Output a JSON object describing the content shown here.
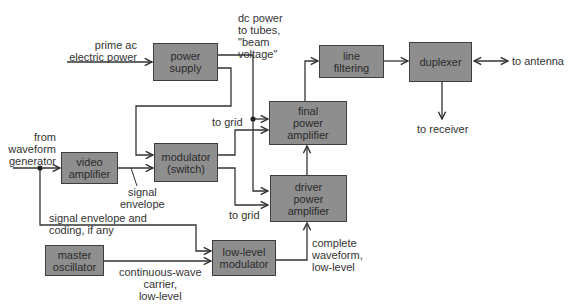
{
  "diagram": {
    "colors": {
      "block_fill": "#8e8e8e",
      "block_border": "#3d3d3d",
      "line": "#333333",
      "text": "#2a2a2a",
      "background": "#ffffff"
    },
    "blocks": {
      "power_supply": "power\nsupply",
      "video_amplifier": "video\namplifier",
      "modulator": "modulator\n(switch)",
      "final_power_amplifier": "final\npower\namplifier",
      "driver_power_amplifier": "driver\npower\namplifier",
      "line_filtering": "line\nfiltering",
      "duplexer": "duplexer",
      "master_oscillator": "master\noscillator",
      "low_level_modulator": "low-level\nmodulator"
    },
    "labels": {
      "prime_ac": "prime ac\nelectric power",
      "dc_power": "dc power\nto tubes,\n\"beam\nvoltage\"",
      "from_waveform": "from\nwaveform\ngenerator",
      "to_grid_upper": "to grid",
      "to_grid_lower": "to grid",
      "signal_envelope": "signal\nenvelope",
      "signal_envelope_coding": "signal envelope and\ncoding, if any",
      "cw_carrier": "continuous-wave\ncarrier,\nlow-level",
      "complete_waveform": "complete\nwaveform,\nlow-level",
      "to_antenna": "to antenna",
      "to_receiver": "to receiver"
    }
  }
}
